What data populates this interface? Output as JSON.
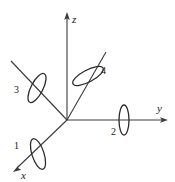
{
  "figure": {
    "background_color": "#ffffff",
    "stroke_color": "#3a3a3a",
    "text_color": "#1a1a1a",
    "width": 175,
    "height": 182
  },
  "axes": {
    "origin": {
      "x": 67,
      "y": 120
    },
    "items": [
      {
        "name": "z",
        "label": "z",
        "direction": "up",
        "tip": {
          "x": 67,
          "y": 13
        },
        "label_position": {
          "x": 72,
          "y": 14
        }
      },
      {
        "name": "y",
        "label": "y",
        "direction": "right",
        "tip": {
          "x": 168,
          "y": 120
        },
        "label_position": {
          "x": 157,
          "y": 103
        }
      },
      {
        "name": "x",
        "label": "x",
        "direction": "down-left",
        "tip": {
          "x": 13,
          "y": 171
        },
        "label_position": {
          "x": 21,
          "y": 170
        }
      }
    ]
  },
  "rays": [
    {
      "name": "ray-upper-left",
      "from": {
        "x": 67,
        "y": 120
      },
      "to": {
        "x": 11,
        "y": 61
      }
    },
    {
      "name": "ray-upper-right",
      "from": {
        "x": 67,
        "y": 120
      },
      "to": {
        "x": 106,
        "y": 52
      }
    }
  ],
  "elements": [
    {
      "id": "1",
      "label": "1",
      "center": {
        "x": 38,
        "y": 154
      },
      "rx": 6,
      "ry": 16,
      "rotation_deg": -18,
      "label_position": {
        "x": 14,
        "y": 141
      },
      "on_axis": "x"
    },
    {
      "id": "2",
      "label": "2",
      "center": {
        "x": 124,
        "y": 120
      },
      "rx": 5,
      "ry": 15,
      "rotation_deg": 0,
      "label_position": {
        "x": 111,
        "y": 127
      },
      "on_axis": "y"
    },
    {
      "id": "3",
      "label": "3",
      "center": {
        "x": 37,
        "y": 88
      },
      "rx": 6,
      "ry": 16,
      "rotation_deg": 27,
      "label_position": {
        "x": 14,
        "y": 85
      },
      "on_axis": "ray-upper-left"
    },
    {
      "id": "4",
      "label": "4",
      "center": {
        "x": 88,
        "y": 76
      },
      "rx": 6,
      "ry": 17,
      "rotation_deg": 62,
      "label_position": {
        "x": 101,
        "y": 66
      },
      "on_axis": "ray-upper-right"
    }
  ]
}
